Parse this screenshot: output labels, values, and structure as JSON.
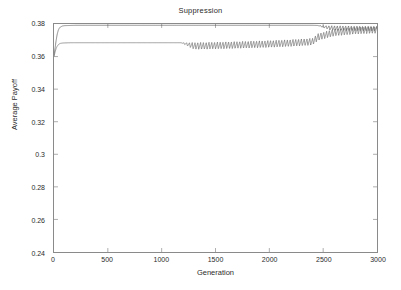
{
  "chart_data": {
    "type": "line",
    "title": "Suppression",
    "xlabel": "Generation",
    "ylabel": "Average Payoff",
    "xlim": [
      0,
      3000
    ],
    "ylim": [
      0.24,
      0.38
    ],
    "xticks": [
      0,
      500,
      1000,
      1500,
      2000,
      2500,
      3000
    ],
    "xtick_labels": [
      "0",
      "500",
      "1000",
      "1500",
      "2000",
      "2500",
      "3000"
    ],
    "yticks": [
      0.24,
      0.26,
      0.28,
      0.3,
      0.32,
      0.34,
      0.36,
      0.38
    ],
    "ytick_labels": [
      "0.24",
      "0.26",
      "0.28",
      "0.3",
      "0.32",
      "0.34",
      "0.36",
      "0.38"
    ],
    "grid": false,
    "legend": false,
    "line_color": "#555555",
    "frame_color": "#8a8a8a",
    "background": "#ffffff",
    "series": [
      {
        "name": "upper-curve",
        "color": "#555555",
        "oscillation_start": 2450,
        "plateau_value": 0.3792,
        "final_value": 0.3785,
        "x": [
          0,
          10,
          20,
          30,
          40,
          50,
          60,
          80,
          100,
          150,
          200,
          300,
          500,
          800,
          1000,
          1200,
          1500,
          1800,
          2000,
          2200,
          2400,
          2450,
          2500,
          2600,
          2700,
          2800,
          2900,
          3000
        ],
        "y": [
          0.3605,
          0.3652,
          0.37,
          0.3738,
          0.3762,
          0.3775,
          0.3782,
          0.3788,
          0.379,
          0.3791,
          0.3792,
          0.3792,
          0.3792,
          0.3792,
          0.3792,
          0.3792,
          0.3792,
          0.3792,
          0.3792,
          0.3792,
          0.3792,
          0.3791,
          0.379,
          0.3789,
          0.3788,
          0.3787,
          0.3786,
          0.3785
        ]
      },
      {
        "name": "lower-curve",
        "color": "#666666",
        "oscillation_start": 1180,
        "plateau_value": 0.3685,
        "merge_point": 2450,
        "final_value": 0.3785,
        "x": [
          0,
          10,
          20,
          30,
          40,
          50,
          60,
          80,
          100,
          150,
          200,
          400,
          600,
          800,
          1000,
          1100,
          1180,
          1400,
          1600,
          1800,
          2000,
          2200,
          2400,
          2450,
          2600,
          2800,
          3000
        ],
        "y": [
          0.36,
          0.3628,
          0.365,
          0.3664,
          0.3673,
          0.3678,
          0.3681,
          0.3683,
          0.3684,
          0.3685,
          0.3685,
          0.3685,
          0.3685,
          0.3685,
          0.3685,
          0.3685,
          0.3685,
          0.3687,
          0.369,
          0.3694,
          0.3698,
          0.3704,
          0.3712,
          0.374,
          0.3768,
          0.378,
          0.3785
        ],
        "oscillation_depth": 0.0042
      }
    ],
    "annotations": []
  }
}
